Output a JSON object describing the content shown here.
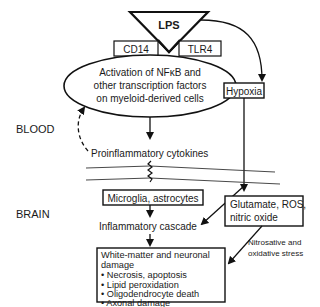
{
  "diagram": {
    "trigger": {
      "label": "LPS"
    },
    "receptors": [
      {
        "label": "CD14"
      },
      {
        "label": "TLR4"
      }
    ],
    "activation": {
      "lines": [
        "Activation of NFκB and",
        "other transcription factors",
        "on myeloid-derived cells"
      ]
    },
    "hypoxia": {
      "label": "Hypoxia"
    },
    "compartments": {
      "blood": "BLOOD",
      "brain": "BRAIN"
    },
    "cytokines": {
      "label": "Proinflammatory cytokines"
    },
    "glia": {
      "label": "Microglia, astrocytes"
    },
    "cascade": {
      "label": "Inflammatory cascade"
    },
    "excitotoxins": {
      "lines": [
        "Glutamate, ROS,",
        "nitric oxide"
      ]
    },
    "stress": {
      "lines": [
        "Nitrosative and",
        "oxidative stress"
      ]
    },
    "damage": {
      "title_lines": [
        "White-matter and neuronal",
        "damage"
      ],
      "items": [
        "• Necrosis, apoptosis",
        "• Lipid peroxidation",
        "• Oligodendrocyte death",
        "• Axonal damage"
      ]
    }
  }
}
